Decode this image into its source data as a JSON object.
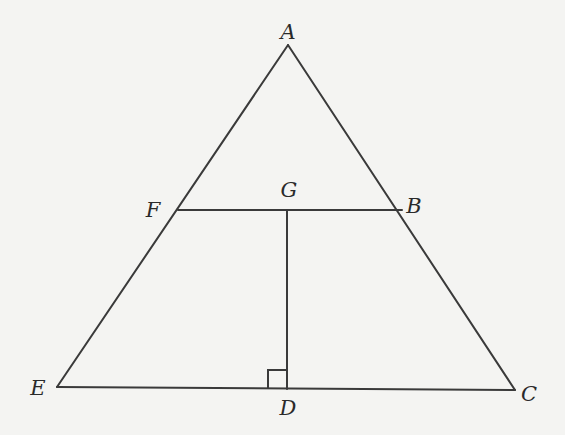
{
  "diagram": {
    "stroke_color": "#3a3a3a",
    "background_color": "#f4f4f2",
    "points": {
      "A": {
        "label": "A",
        "x": 288,
        "y": 45,
        "label_x": 288,
        "label_y": 32
      },
      "F": {
        "label": "F",
        "x": 178,
        "y": 210,
        "label_x": 153,
        "label_y": 210
      },
      "G": {
        "label": "G",
        "x": 287,
        "y": 210,
        "label_x": 289,
        "label_y": 190
      },
      "B": {
        "label": "B",
        "x": 402,
        "y": 210,
        "label_x": 414,
        "label_y": 206
      },
      "E": {
        "label": "E",
        "x": 57,
        "y": 387,
        "label_x": 38,
        "label_y": 388
      },
      "D": {
        "label": "D",
        "x": 287,
        "y": 389,
        "label_x": 288,
        "label_y": 408
      },
      "C": {
        "label": "C",
        "x": 515,
        "y": 390,
        "label_x": 529,
        "label_y": 394
      }
    },
    "segments": [
      {
        "name": "segment-AE",
        "from": "A",
        "to": "E"
      },
      {
        "name": "segment-AC",
        "from": "A",
        "to": "C"
      },
      {
        "name": "segment-EC",
        "from": "E",
        "to": "C"
      },
      {
        "name": "segment-FB",
        "from": "F",
        "to": "B"
      },
      {
        "name": "segment-GD",
        "from": "G",
        "to": "D"
      }
    ],
    "right_angle_marker": {
      "at": "D",
      "size": 19,
      "side": "left"
    }
  }
}
